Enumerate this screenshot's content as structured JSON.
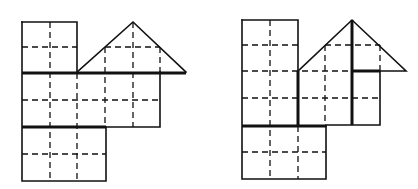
{
  "figures": [
    {
      "id": "left",
      "description": "Composite of squares and triangle with dashed quarter grid; thick lines dividing into three horizontal strips",
      "outline_polylines": [
        [
          [
            22,
            22
          ],
          [
            77,
            22
          ],
          [
            77,
            72
          ]
        ],
        [
          [
            22,
            22
          ],
          [
            22,
            181
          ],
          [
            106,
            181
          ],
          [
            106,
            127
          ]
        ],
        [
          [
            106,
            127
          ],
          [
            160,
            127
          ],
          [
            160,
            72
          ]
        ],
        [
          [
            77,
            72
          ],
          [
            133,
            22
          ],
          [
            186,
            72
          ]
        ]
      ],
      "thick_lines": [
        [
          [
            22,
            73
          ],
          [
            186,
            73
          ]
        ],
        [
          [
            22,
            127
          ],
          [
            106,
            127
          ]
        ]
      ],
      "dashed_lines": [
        [
          [
            50,
            22
          ],
          [
            50,
            181
          ]
        ],
        [
          [
            22,
            47
          ],
          [
            77,
            47
          ]
        ],
        [
          [
            77,
            73
          ],
          [
            77,
            181
          ]
        ],
        [
          [
            105,
            47
          ],
          [
            160,
            47
          ]
        ],
        [
          [
            105,
            47
          ],
          [
            105,
            127
          ]
        ],
        [
          [
            133,
            22
          ],
          [
            133,
            127
          ]
        ],
        [
          [
            160,
            47
          ],
          [
            160,
            72
          ]
        ],
        [
          [
            22,
            100
          ],
          [
            160,
            100
          ]
        ],
        [
          [
            22,
            154
          ],
          [
            106,
            154
          ]
        ]
      ]
    },
    {
      "id": "right",
      "description": "Same composite rearranged; thick lines dividing into vertical strips",
      "outline_polylines": [
        [
          [
            242,
            20
          ],
          [
            298,
            20
          ],
          [
            298,
            71
          ]
        ],
        [
          [
            242,
            20
          ],
          [
            242,
            179
          ],
          [
            326,
            179
          ],
          [
            326,
            126
          ]
        ],
        [
          [
            326,
            126
          ],
          [
            326,
            125
          ],
          [
            380,
            125
          ],
          [
            380,
            71
          ]
        ],
        [
          [
            298,
            71
          ],
          [
            352,
            20
          ],
          [
            406,
            71
          ],
          [
            380,
            71
          ]
        ]
      ],
      "thick_lines": [
        [
          [
            298,
            71
          ],
          [
            298,
            126
          ]
        ],
        [
          [
            352,
            20
          ],
          [
            352,
            125
          ]
        ],
        [
          [
            352,
            71
          ],
          [
            380,
            71
          ]
        ],
        [
          [
            242,
            126
          ],
          [
            326,
            126
          ]
        ]
      ],
      "dashed_lines": [
        [
          [
            270,
            20
          ],
          [
            270,
            179
          ]
        ],
        [
          [
            242,
            45
          ],
          [
            298,
            45
          ]
        ],
        [
          [
            242,
            71
          ],
          [
            352,
            71
          ]
        ],
        [
          [
            242,
            98
          ],
          [
            380,
            98
          ]
        ],
        [
          [
            298,
            126
          ],
          [
            298,
            179
          ]
        ],
        [
          [
            325,
            45
          ],
          [
            380,
            45
          ]
        ],
        [
          [
            325,
            45
          ],
          [
            325,
            126
          ]
        ],
        [
          [
            380,
            45
          ],
          [
            380,
            71
          ]
        ],
        [
          [
            242,
            152
          ],
          [
            326,
            152
          ]
        ]
      ]
    }
  ]
}
